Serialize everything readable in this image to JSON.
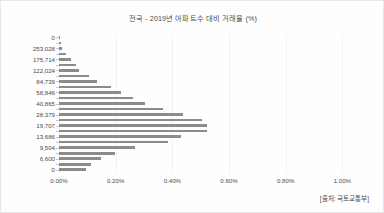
{
  "chart_data": {
    "type": "bar",
    "orientation": "horizontal",
    "title": "전국 - 2019년 아파트수 대비 거래율 (%)",
    "xlabel": "",
    "ylabel": "",
    "xlim": [
      0,
      1.08
    ],
    "ylim": null,
    "grid": true,
    "legend": null,
    "xticklabels": [
      "0.00%",
      "0.20%",
      "0.40%",
      "0.60%",
      "0.80%",
      "1.00%"
    ],
    "xtickvalues": [
      0.0,
      0.2,
      0.4,
      0.6,
      0.8,
      1.0
    ],
    "yticklabels": [
      "0",
      "253,028",
      "175,714",
      "122,024",
      "84,739",
      "58,846",
      "40,865",
      "28,379",
      "19,707",
      "13,686",
      "9,504",
      "6,600",
      "0"
    ],
    "categories": [
      "0",
      "",
      "253,028",
      "",
      "175,714",
      "",
      "122,024",
      "",
      "84,739",
      "",
      "58,846",
      "",
      "40,865",
      "",
      "28,379",
      "",
      "19,707",
      "",
      "13,686",
      "",
      "9,504",
      "",
      "6,600",
      "",
      "0"
    ],
    "values": [
      0.003,
      0.006,
      0.012,
      0.026,
      0.041,
      0.06,
      0.072,
      0.106,
      0.134,
      0.183,
      0.219,
      0.262,
      0.302,
      0.367,
      0.438,
      0.505,
      0.523,
      0.523,
      0.432,
      0.384,
      0.267,
      0.199,
      0.149,
      0.114,
      0.095
    ],
    "bar_color": "#8b8b8b",
    "source": "[출처: 국토교통부]"
  },
  "figure": {
    "title": "전국 - 2019년 아파트수 대비 거래율 (%)",
    "source_note": "[출처: 국토교통부]"
  }
}
